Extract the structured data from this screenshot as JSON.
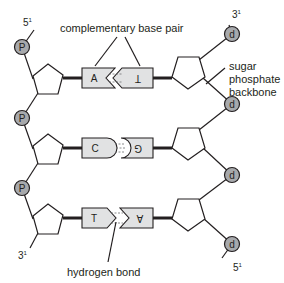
{
  "diagram": {
    "labels": {
      "complementary_base_pair": "complementary base pair",
      "sugar_phosphate_backbone_line1": "sugar",
      "sugar_phosphate_backbone_line2": "phosphate",
      "sugar_phosphate_backbone_line3": "backbone",
      "hydrogen_bond": "hydrogen bond"
    },
    "left_strand": {
      "top_end": "5",
      "top_end_sup": "1",
      "bottom_end": "3",
      "bottom_end_sup": "1",
      "phosphate_symbol": "P",
      "phosphates": [
        "P",
        "P",
        "P"
      ]
    },
    "right_strand": {
      "top_end": "3",
      "top_end_sup": "1",
      "bottom_end": "5",
      "bottom_end_sup": "1",
      "phosphate_symbol": "d",
      "phosphates": [
        "d",
        "d",
        "d",
        "d"
      ]
    },
    "base_pairs": [
      {
        "left": "A",
        "right": "T",
        "right_inverted": true,
        "hydrogen_bonds": 2,
        "shape": "notch"
      },
      {
        "left": "C",
        "right": "G",
        "right_inverted": true,
        "hydrogen_bonds": 3,
        "shape": "round"
      },
      {
        "left": "T",
        "right": "A",
        "right_inverted": true,
        "hydrogen_bonds": 2,
        "shape": "arrow"
      }
    ],
    "colors": {
      "phosphate_fill": "#a7a9ac",
      "base_fill": "#e1e2e3",
      "line": "#231f20",
      "sugar_fill": "#ffffff"
    }
  }
}
